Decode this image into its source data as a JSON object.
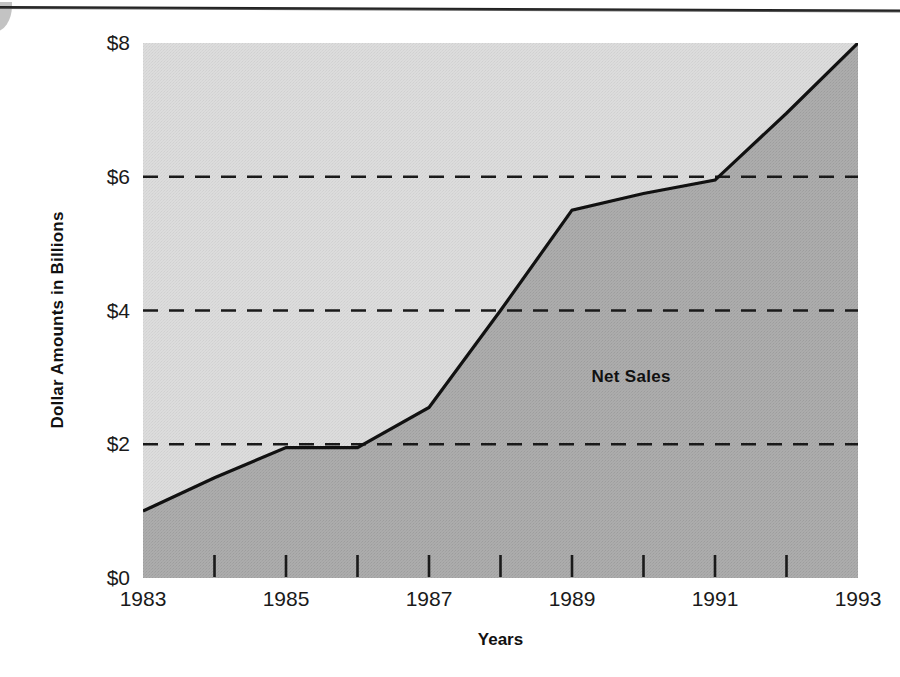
{
  "figure": {
    "series_label": "Net Sales",
    "axis": {
      "ylabel": "Dollar Amounts in Billions",
      "xlabel": "Years"
    }
  },
  "chart_data": {
    "type": "area",
    "title": "",
    "subtitle": "",
    "xlabel": "Years",
    "ylabel": "Dollar Amounts in Billions",
    "xlim": [
      1983,
      1993
    ],
    "ylim": [
      0,
      8
    ],
    "y_tick_labels": [
      "$0",
      "$2",
      "$4",
      "$6",
      "$8"
    ],
    "y_ticks": [
      0,
      2,
      4,
      6,
      8
    ],
    "x_tick_labels": [
      "1983",
      "1985",
      "1987",
      "1989",
      "1991",
      "1993"
    ],
    "x_ticks": [
      1983,
      1985,
      1987,
      1989,
      1991,
      1993
    ],
    "x_minor_ticks": [
      1984,
      1985,
      1986,
      1987,
      1988,
      1989,
      1990,
      1991,
      1992
    ],
    "grid": "horizontal-dashed-at-2-4-6",
    "gridlines": [
      2,
      4,
      6
    ],
    "legend": "inline-annotation",
    "annotations": [
      {
        "text": "Net Sales",
        "x": 1990.0,
        "y": 3.0
      }
    ],
    "series": [
      {
        "name": "Net Sales",
        "x": [
          1983,
          1984,
          1985,
          1986,
          1987,
          1988,
          1989,
          1990,
          1991,
          1992,
          1993
        ],
        "values": [
          1.0,
          1.5,
          1.95,
          1.95,
          2.55,
          4.0,
          5.5,
          5.75,
          5.95,
          6.95,
          8.0
        ],
        "units": "billions of dollars"
      }
    ],
    "fill_above_color": "#d9d9d9",
    "fill_below_color": "#a9a9a9",
    "line_color": "#111111"
  }
}
